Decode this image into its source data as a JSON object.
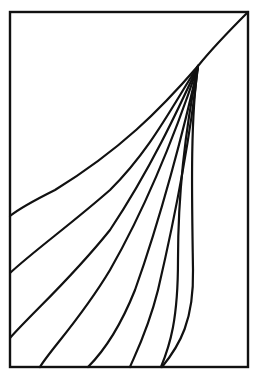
{
  "diagram": {
    "stroke_color": "#111111",
    "background_color": "#ffffff",
    "curve_count": 9,
    "curves_ending_left_edge": 3,
    "curves_ending_bottom_edge": 6
  }
}
